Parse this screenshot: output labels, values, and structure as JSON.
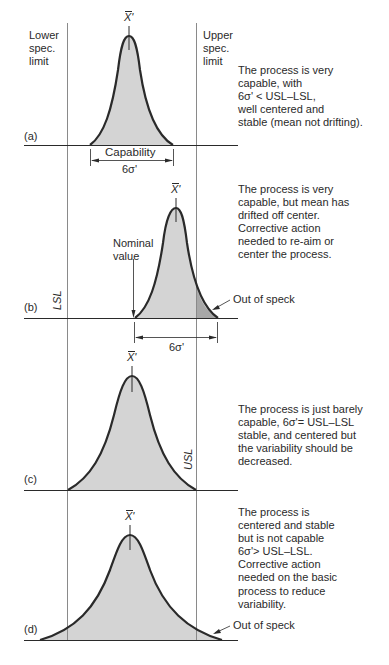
{
  "figure": {
    "spec_limits": {
      "lower_label_lines": [
        "Lower",
        "spec.",
        "limit"
      ],
      "upper_label_lines": [
        "Upper",
        "spec.",
        "limit"
      ],
      "lsl_abbrev": "LSL",
      "usl_abbrev": "USL"
    },
    "mean_symbol": "X'",
    "sigma_symbol": "6σ'",
    "panels": [
      {
        "id": "a",
        "tag": "(a)",
        "description_lines": [
          "The process is very",
          "capable, with",
          "6σ' < USL–LSL,",
          "well centered and",
          "stable (mean not drifting)."
        ],
        "capability_label": "Capability",
        "capability_span": "6σ'"
      },
      {
        "id": "b",
        "tag": "(b)",
        "description_lines": [
          "The process is very",
          "capable, but mean has",
          "drifted off center.",
          "Corrective action",
          "needed to re-aim or",
          "center the process."
        ],
        "nominal_label_lines": [
          "Nominal",
          "value"
        ],
        "out_of_spec_label": "Out of speck",
        "capability_span": "6σ'"
      },
      {
        "id": "c",
        "tag": "(c)",
        "description_lines": [
          "The process is just barely",
          "capable, 6σ'= USL–LSL",
          "stable, and centered but",
          "the variability should be",
          "decreased."
        ]
      },
      {
        "id": "d",
        "tag": "(d)",
        "description_lines": [
          "The process is",
          "centered and stable",
          "but is not capable",
          "6σ'> USL–LSL.",
          "Corrective action",
          "needed on the basic",
          "process to reduce",
          "variability."
        ],
        "out_of_spec_label": "Out of speck"
      }
    ],
    "colors": {
      "line": "#2a2a2a",
      "fill": "#d4d4d4",
      "out_of_spec_fill": "#a8a8a8",
      "spec_line": "#8a8a8a"
    }
  }
}
